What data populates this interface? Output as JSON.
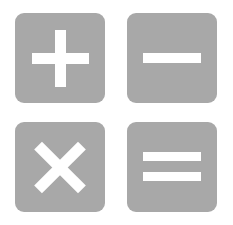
{
  "tiles": [
    {
      "symbol": "plus",
      "label": "+"
    },
    {
      "symbol": "minus",
      "label": "−"
    },
    {
      "symbol": "times",
      "label": "×"
    },
    {
      "symbol": "equals",
      "label": "="
    }
  ],
  "colors": {
    "tile": "#a8a8a8",
    "glyph": "#ffffff",
    "background": "#ffffff"
  }
}
